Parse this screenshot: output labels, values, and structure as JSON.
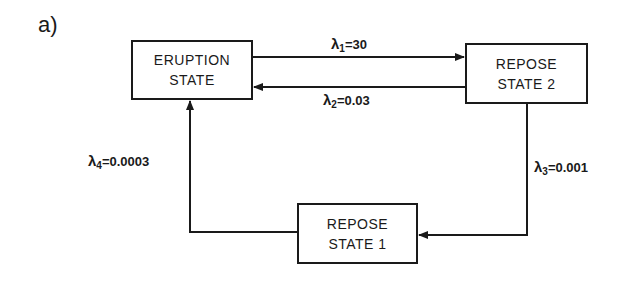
{
  "panel_label": "a)",
  "states": {
    "eruption": {
      "line1": "ERUPTION",
      "line2": "STATE"
    },
    "repose2": {
      "line1": "REPOSE",
      "line2": "STATE 2"
    },
    "repose1": {
      "line1": "REPOSE",
      "line2": "STATE 1"
    }
  },
  "transitions": [
    {
      "symbol": "λ",
      "sub": "1",
      "value": "=30",
      "from": "ERUPTION STATE",
      "to": "REPOSE STATE 2"
    },
    {
      "symbol": "λ",
      "sub": "2",
      "value": "=0.03",
      "from": "REPOSE STATE 2",
      "to": "ERUPTION STATE"
    },
    {
      "symbol": "λ",
      "sub": "3",
      "value": "=0.001",
      "from": "REPOSE STATE 2",
      "to": "REPOSE STATE 1"
    },
    {
      "symbol": "λ",
      "sub": "4",
      "value": "=0.0003",
      "from": "REPOSE STATE 1",
      "to": "ERUPTION STATE"
    }
  ]
}
